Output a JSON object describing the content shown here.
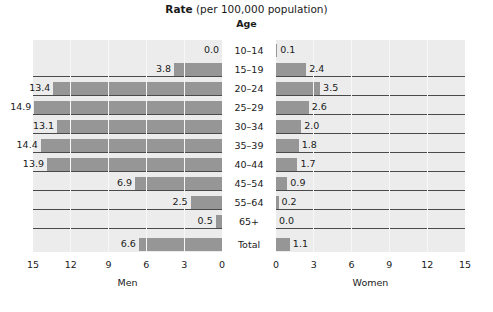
{
  "title": {
    "strong": "Rate",
    "rest": " (per 100,000 population)"
  },
  "age_header": "Age",
  "chart_data": {
    "type": "bar",
    "title": "Rate (per 100,000 population)",
    "subtitle": "Age",
    "orientation": "horizontal",
    "layout": "population-pyramid",
    "categories": [
      "10–14",
      "15–19",
      "20–24",
      "25–29",
      "30–34",
      "35–39",
      "40–44",
      "45–54",
      "55–64",
      "65+",
      "Total"
    ],
    "series": [
      {
        "name": "Men",
        "side": "left",
        "values": [
          0.0,
          3.8,
          13.4,
          14.9,
          13.1,
          14.4,
          13.9,
          6.9,
          2.5,
          0.5,
          6.6
        ],
        "labels": [
          "0.0",
          "3.8",
          "13.4",
          "14.9",
          "13.1",
          "14.4",
          "13.9",
          "6.9",
          "2.5",
          "0.5",
          "6.6"
        ]
      },
      {
        "name": "Women",
        "side": "right",
        "values": [
          0.1,
          2.4,
          3.5,
          2.6,
          2.0,
          1.8,
          1.7,
          0.9,
          0.2,
          0.0,
          1.1
        ],
        "labels": [
          "0.1",
          "2.4",
          "3.5",
          "2.6",
          "2.0",
          "1.8",
          "1.7",
          "0.9",
          "0.2",
          "0.0",
          "1.1"
        ]
      }
    ],
    "xlabel_left": "Men",
    "xlabel_right": "Women",
    "ylabel": "Age",
    "xlim": [
      0,
      15
    ],
    "ticks_left": [
      "15",
      "12",
      "9",
      "6",
      "3",
      "0"
    ],
    "ticks_right": [
      "0",
      "3",
      "6",
      "9",
      "12",
      "15"
    ],
    "tick_values": [
      0,
      3,
      6,
      9,
      12,
      15
    ],
    "grid": true,
    "legend": "none",
    "bar_color": "#969696",
    "panel_color": "#ececec",
    "text_color": "#1a1a1a"
  }
}
